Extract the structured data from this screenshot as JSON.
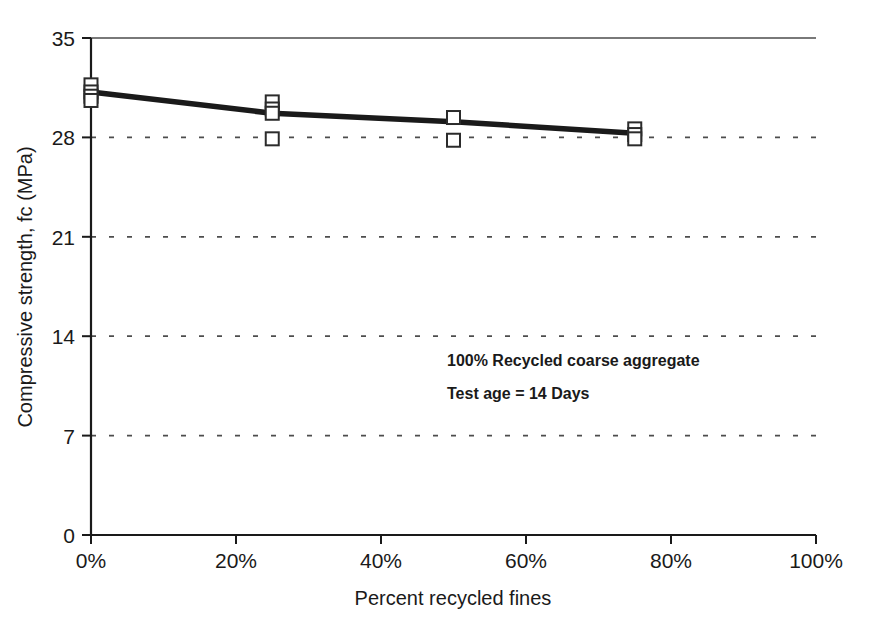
{
  "chart_data": {
    "type": "scatter",
    "title": "",
    "xlabel": "Percent recycled fines",
    "ylabel": "Compressive strength, fc (MPa)",
    "xlim": [
      0,
      100
    ],
    "ylim": [
      0,
      35
    ],
    "x_tick_labels": [
      "0%",
      "20%",
      "40%",
      "60%",
      "80%",
      "100%"
    ],
    "x_tick_values": [
      0,
      20,
      40,
      60,
      80,
      100
    ],
    "y_tick_labels": [
      "0",
      "7",
      "14",
      "21",
      "28",
      "35"
    ],
    "y_tick_values": [
      0,
      7,
      14,
      21,
      28,
      35
    ],
    "grid": "horizontal-dashed",
    "legend": "none",
    "series": [
      {
        "name": "Individual specimen results",
        "marker": "open-square",
        "points": [
          {
            "x": 0,
            "y": 31.7
          },
          {
            "x": 0,
            "y": 31.2
          },
          {
            "x": 0,
            "y": 30.9
          },
          {
            "x": 0,
            "y": 30.6
          },
          {
            "x": 25,
            "y": 30.5
          },
          {
            "x": 25,
            "y": 30.0
          },
          {
            "x": 25,
            "y": 29.7
          },
          {
            "x": 25,
            "y": 27.9
          },
          {
            "x": 50,
            "y": 29.4
          },
          {
            "x": 50,
            "y": 27.8
          },
          {
            "x": 75,
            "y": 28.6
          },
          {
            "x": 75,
            "y": 28.2
          },
          {
            "x": 75,
            "y": 27.9
          }
        ]
      },
      {
        "name": "Mean trend line",
        "marker": "none",
        "line": "solid-thick",
        "points": [
          {
            "x": 0,
            "y": 31.2
          },
          {
            "x": 25,
            "y": 29.7
          },
          {
            "x": 50,
            "y": 29.1
          },
          {
            "x": 75,
            "y": 28.3
          }
        ]
      }
    ],
    "annotations": [
      "100% Recycled  coarse aggregate",
      "Test age = 14 Days"
    ]
  },
  "colors": {
    "axis": "#1a1a1a",
    "grid": "#4d4d4d",
    "line": "#1a1a1a",
    "marker_stroke": "#2b2b2b",
    "marker_fill": "#ffffff",
    "background": "#ffffff"
  }
}
